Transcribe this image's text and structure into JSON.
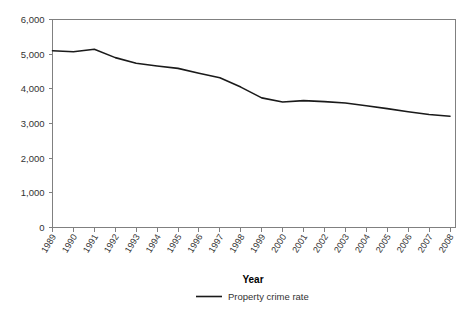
{
  "chart_data": {
    "type": "line",
    "title": "",
    "xlabel": "Year",
    "ylabel": "",
    "grid": false,
    "legend_position": "bottom-center",
    "categories": [
      "1989",
      "1990",
      "1991",
      "1992",
      "1993",
      "1994",
      "1995",
      "1996",
      "1997",
      "1998",
      "1999",
      "2000",
      "2001",
      "2002",
      "2003",
      "2004",
      "2005",
      "2006",
      "2007",
      "2008"
    ],
    "x": [
      1989,
      1990,
      1991,
      1992,
      1993,
      1994,
      1995,
      1996,
      1997,
      1998,
      1999,
      2000,
      2001,
      2002,
      2003,
      2004,
      2005,
      2006,
      2007,
      2008
    ],
    "xlim": [
      1989,
      2008
    ],
    "ylim": [
      0,
      6000
    ],
    "yticks": [
      0,
      1000,
      2000,
      3000,
      4000,
      5000,
      6000
    ],
    "ytick_labels": [
      "0",
      "1,000",
      "2,000",
      "3,000",
      "4,000",
      "5,000",
      "6,000"
    ],
    "series": [
      {
        "name": "Property crime rate",
        "color": "#1a1a1a",
        "values": [
          5100,
          5070,
          5140,
          4900,
          4740,
          4660,
          4590,
          4450,
          4320,
          4050,
          3740,
          3620,
          3660,
          3630,
          3590,
          3510,
          3430,
          3340,
          3260,
          3210
        ]
      }
    ]
  },
  "axes": {
    "x_title": "Year",
    "y_tick_labels": [
      "6,000",
      "5,000",
      "4,000",
      "3,000",
      "2,000",
      "1,000",
      "0"
    ],
    "x_tick_labels": [
      "1989",
      "1990",
      "1991",
      "1992",
      "1993",
      "1994",
      "1995",
      "1996",
      "1997",
      "1998",
      "1999",
      "2000",
      "2001",
      "2002",
      "2003",
      "2004",
      "2005",
      "2006",
      "2007",
      "2008"
    ]
  },
  "legend": {
    "entries": [
      {
        "label": "Property crime rate",
        "color": "#1a1a1a",
        "marker": "line-swatch"
      }
    ]
  }
}
